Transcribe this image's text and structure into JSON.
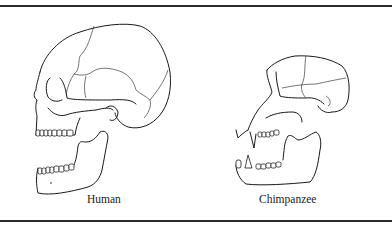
{
  "figure": {
    "panels": [
      {
        "id": "human",
        "label": "Human"
      },
      {
        "id": "chimpanzee",
        "label": "Chimpanzee"
      }
    ]
  },
  "colors": {
    "background": "#ffffff",
    "line": "#1a1a1a",
    "rule": "#2a2a2a"
  }
}
